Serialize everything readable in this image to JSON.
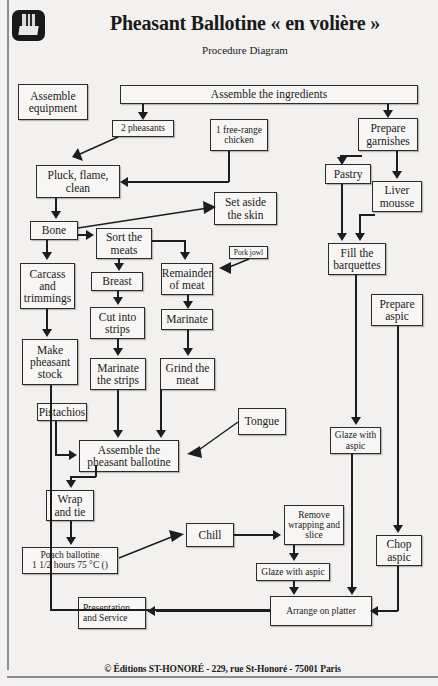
{
  "header": {
    "logo_icon": "chef-logo-icon",
    "title": "Pheasant Ballotine « en volière »",
    "subtitle": "Procedure Diagram"
  },
  "footer": {
    "text": "© Éditions ST-HONORÉ - 229, rue St-Honoré - 75001 Paris"
  },
  "diagram": {
    "type": "flowchart",
    "nodes": [
      {
        "id": "assemble_equipment",
        "label": "Assemble equipment"
      },
      {
        "id": "assemble_ingredients",
        "label": "Assemble the ingredients"
      },
      {
        "id": "two_pheasants",
        "label": "2 pheasants"
      },
      {
        "id": "free_range_chicken",
        "label": "1 free-range chicken"
      },
      {
        "id": "prepare_garnishes",
        "label": "Prepare garnishes"
      },
      {
        "id": "pastry",
        "label": "Pastry"
      },
      {
        "id": "liver_mousse",
        "label": "Liver mousse"
      },
      {
        "id": "pluck_flame_clean",
        "label": "Pluck, flame, clean"
      },
      {
        "id": "set_aside_skin",
        "label": "Set aside the skin"
      },
      {
        "id": "bone",
        "label": "Bone"
      },
      {
        "id": "sort_the_meats",
        "label": "Sort the meats"
      },
      {
        "id": "pork_jowl",
        "label": "Pork jowl"
      },
      {
        "id": "fill_barquettes",
        "label": "Fill the barquettes"
      },
      {
        "id": "carcass_trimmings",
        "label": "Carcass and trimmings"
      },
      {
        "id": "breast",
        "label": "Breast"
      },
      {
        "id": "remainder_of_meat",
        "label": "Remainder of meat"
      },
      {
        "id": "cut_into_strips",
        "label": "Cut into strips"
      },
      {
        "id": "marinate",
        "label": "Marinate"
      },
      {
        "id": "prepare_aspic",
        "label": "Prepare aspic"
      },
      {
        "id": "make_pheasant_stock",
        "label": "Make pheasant stock"
      },
      {
        "id": "marinate_the_strips",
        "label": "Marinate the strips"
      },
      {
        "id": "grind_the_meat",
        "label": "Grind the meat"
      },
      {
        "id": "pistachios",
        "label": "Pistachios"
      },
      {
        "id": "tongue",
        "label": "Tongue"
      },
      {
        "id": "assemble_ballotine",
        "label": "Assemble the pheasant ballotine"
      },
      {
        "id": "glaze_with_aspic_1",
        "label": "Glaze with aspic"
      },
      {
        "id": "wrap_and_tie",
        "label": "Wrap and tie"
      },
      {
        "id": "chill",
        "label": "Chill"
      },
      {
        "id": "remove_wrapping",
        "label": "Remove wrapping and slice"
      },
      {
        "id": "chop_aspic",
        "label": "Chop aspic"
      },
      {
        "id": "poach_ballotine",
        "label": "Poach ballotine 1 1/2 hours 75 °C ()"
      },
      {
        "id": "poach_line1",
        "label": "Poach ballotine"
      },
      {
        "id": "poach_line2",
        "label": "1 1/2 hours 75 °C ()"
      },
      {
        "id": "glaze_with_aspic_2",
        "label": "Glaze with aspic"
      },
      {
        "id": "presentation",
        "label": "Presentation and Service"
      },
      {
        "id": "arrange_on_platter",
        "label": "Arrange on platter"
      }
    ],
    "edges": [
      [
        "assemble_ingredients",
        "two_pheasants"
      ],
      [
        "assemble_ingredients",
        "prepare_garnishes"
      ],
      [
        "two_pheasants",
        "pluck_flame_clean"
      ],
      [
        "free_range_chicken",
        "pluck_flame_clean"
      ],
      [
        "prepare_garnishes",
        "pastry"
      ],
      [
        "prepare_garnishes",
        "liver_mousse"
      ],
      [
        "pastry",
        "fill_barquettes"
      ],
      [
        "liver_mousse",
        "fill_barquettes"
      ],
      [
        "pluck_flame_clean",
        "bone"
      ],
      [
        "bone",
        "set_aside_skin"
      ],
      [
        "bone",
        "sort_the_meats"
      ],
      [
        "bone",
        "carcass_trimmings"
      ],
      [
        "sort_the_meats",
        "breast"
      ],
      [
        "sort_the_meats",
        "remainder_of_meat"
      ],
      [
        "pork_jowl",
        "remainder_of_meat"
      ],
      [
        "carcass_trimmings",
        "make_pheasant_stock"
      ],
      [
        "breast",
        "cut_into_strips"
      ],
      [
        "remainder_of_meat",
        "marinate"
      ],
      [
        "cut_into_strips",
        "marinate_the_strips"
      ],
      [
        "marinate",
        "grind_the_meat"
      ],
      [
        "marinate_the_strips",
        "assemble_ballotine"
      ],
      [
        "grind_the_meat",
        "assemble_ballotine"
      ],
      [
        "pistachios",
        "assemble_ballotine"
      ],
      [
        "tongue",
        "assemble_ballotine"
      ],
      [
        "assemble_ballotine",
        "wrap_and_tie"
      ],
      [
        "wrap_and_tie",
        "poach_ballotine"
      ],
      [
        "poach_ballotine",
        "chill"
      ],
      [
        "chill",
        "remove_wrapping"
      ],
      [
        "remove_wrapping",
        "glaze_with_aspic_2"
      ],
      [
        "glaze_with_aspic_2",
        "arrange_on_platter"
      ],
      [
        "fill_barquettes",
        "glaze_with_aspic_1"
      ],
      [
        "glaze_with_aspic_1",
        "arrange_on_platter"
      ],
      [
        "prepare_aspic",
        "chop_aspic"
      ],
      [
        "chop_aspic",
        "arrange_on_platter"
      ],
      [
        "make_pheasant_stock",
        "arrange_on_platter"
      ],
      [
        "arrange_on_platter",
        "presentation"
      ]
    ]
  }
}
